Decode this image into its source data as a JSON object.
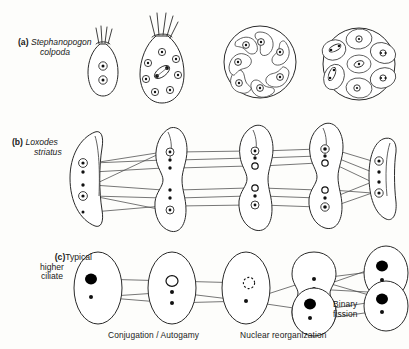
{
  "figure": {
    "rows": [
      {
        "id": "a",
        "tag": "(a)",
        "name_line1": "Stephanopogon",
        "name_line2": "colpoda",
        "italic": true,
        "stages": [
          {
            "name": "vegetative-cell-two-nuclei",
            "nuclei": 2,
            "form": "pear-with-cilia"
          },
          {
            "name": "multinucleate-cell-dividing-nucleus",
            "nuclei": 8,
            "form": "pear-with-cilia"
          },
          {
            "name": "cyst-rosette-daughter-cells",
            "nuclei": 7,
            "form": "round-cyst"
          },
          {
            "name": "cyst-with-oval-daughter-cells",
            "nuclei": 7,
            "form": "round-cyst"
          }
        ]
      },
      {
        "id": "b",
        "tag": "(b)",
        "name_line1": "Loxodes",
        "name_line2": "striatus",
        "italic": true,
        "stages": [
          {
            "name": "loxodes-vegetative",
            "form": "crescent"
          },
          {
            "name": "loxodes-dividing",
            "form": "dumbbell"
          },
          {
            "name": "loxodes-dividing-2",
            "form": "dumbbell"
          },
          {
            "name": "loxodes-dividing-3",
            "form": "dumbbell"
          },
          {
            "name": "loxodes-daughter",
            "form": "crescent"
          }
        ]
      },
      {
        "id": "c",
        "tag": "(c)",
        "name_line1": "Typical",
        "name_line2": "higher",
        "name_line3": "ciliate",
        "italic": false,
        "stages": [
          {
            "name": "ciliate-macronucleus-intact",
            "macronucleus": "solid"
          },
          {
            "name": "ciliate-macronucleus-resorbing",
            "macronucleus": "open"
          },
          {
            "name": "ciliate-macronucleus-fragmenting",
            "macronucleus": "dashed"
          },
          {
            "name": "ciliate-dividing",
            "macronucleus": "none"
          },
          {
            "name": "ciliate-new-macronuclei",
            "macronucleus": "solid"
          },
          {
            "name": "ciliate-binary-fission-product",
            "macronucleus": "solid"
          }
        ]
      }
    ],
    "captions": {
      "conjugation": "Conjugation / Autogamy",
      "nuclear_reorganization": "Nuclear reorganization",
      "binary_fission_line1": "Binary",
      "binary_fission_line2": "fission"
    },
    "colors": {
      "ink": "#1a1a1a",
      "outline": "#2a2a2a",
      "connector": "#4a4a4a",
      "paper": "#fdfdfb",
      "nucleus_solid": "#000000"
    }
  }
}
